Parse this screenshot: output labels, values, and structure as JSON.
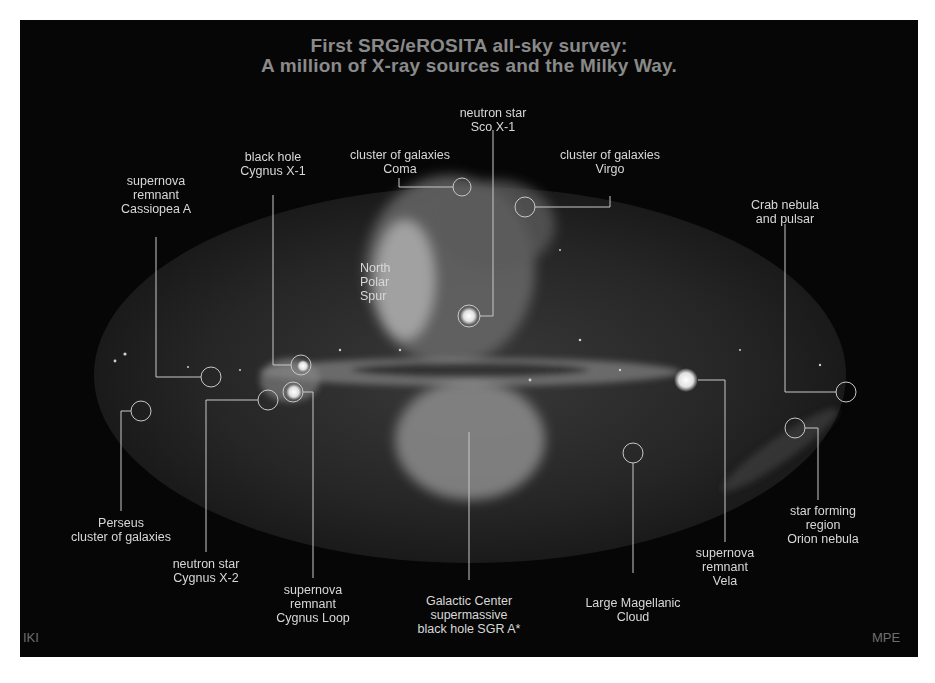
{
  "title": {
    "line1": "First SRG/eROSITA all-sky survey:",
    "line2": "A million of X-ray sources and the Milky Way."
  },
  "labels": {
    "cassiopea": {
      "l1": "supernova",
      "l2": "remnant",
      "l3": "Cassiopea A"
    },
    "cygnus_x1": {
      "l1": "black hole",
      "l2": "Cygnus X-1"
    },
    "coma": {
      "l1": "cluster of galaxies",
      "l2": "Coma"
    },
    "sco_x1": {
      "l1": "neutron star",
      "l2": "Sco X-1"
    },
    "virgo": {
      "l1": "cluster of galaxies",
      "l2": "Virgo"
    },
    "crab": {
      "l1": "Crab nebula",
      "l2": "and pulsar"
    },
    "north_polar_spur": {
      "l1": "North",
      "l2": "Polar",
      "l3": "Spur"
    },
    "perseus": {
      "l1": "Perseus",
      "l2": "cluster of galaxies"
    },
    "cygnus_x2": {
      "l1": "neutron star",
      "l2": "Cygnus X-2"
    },
    "cygnus_loop": {
      "l1": "supernova",
      "l2": "remnant",
      "l3": "Cygnus Loop"
    },
    "galactic_center": {
      "l1": "Galactic Center",
      "l2": "supermassive",
      "l3": "black hole SGR A*"
    },
    "lmc": {
      "l1": "Large Magellanic",
      "l2": "Cloud"
    },
    "vela": {
      "l1": "supernova",
      "l2": "remnant",
      "l3": "Vela"
    },
    "orion": {
      "l1": "star forming",
      "l2": "region",
      "l3": "Orion nebula"
    }
  },
  "credits": {
    "left": "IKI",
    "right": "MPE"
  },
  "colors": {
    "background": "#060606",
    "title": "#8a8a8a",
    "label": "#d8d8d8",
    "line": "#c8c8c8"
  }
}
